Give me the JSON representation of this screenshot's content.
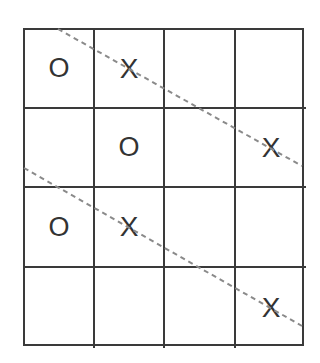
{
  "board": {
    "rows": 4,
    "cols": 4,
    "cells": [
      [
        "O",
        "X",
        "",
        ""
      ],
      [
        "",
        "O",
        "",
        "X"
      ],
      [
        "O",
        "X",
        "",
        ""
      ],
      [
        "",
        "",
        "",
        "X"
      ]
    ]
  },
  "lines": [
    {
      "name": "diagonal-line-upper",
      "x1": 58,
      "y1": 29,
      "x2": 302,
      "y2": 166
    },
    {
      "name": "diagonal-line-lower",
      "x1": 24,
      "y1": 168,
      "x2": 302,
      "y2": 326
    }
  ],
  "colors": {
    "grid": "#3a3a3a",
    "mark": "#333333",
    "dashed_line": "#8a8a8a"
  }
}
